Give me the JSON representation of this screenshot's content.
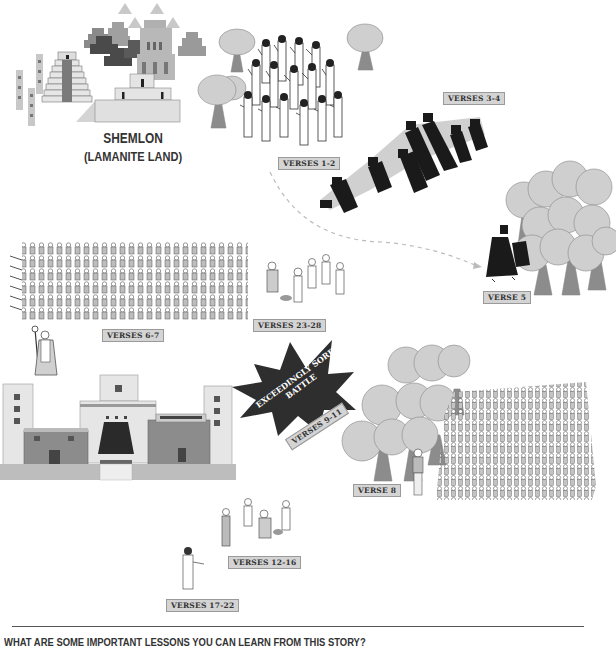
{
  "location": {
    "name": "SHEMLON",
    "subtitle": "(LAMANITE LAND)"
  },
  "labels": {
    "verses_1_2": "VERSES 1-2",
    "verses_3_4": "VERSES 3-4",
    "verse_5": "VERSE 5",
    "verses_6_7": "VERSES 6-7",
    "verses_23_28": "VERSES 23-28",
    "verse_8": "VERSE 8",
    "verses_9_11": "VERSES 9-11",
    "verses_12_16": "VERSES 12-16",
    "verses_17_22": "VERSES 17-22"
  },
  "battle": {
    "line1": "EXCEEDINGLY SORE",
    "line2": "BATTLE"
  },
  "footer": {
    "question": "WHAT ARE SOME IMPORTANT LESSONS YOU CAN LEARN FROM THIS STORY?"
  },
  "colors": {
    "dark": "#3a3a3a",
    "mid": "#8a8a8a",
    "light": "#c8c8c8",
    "tree": "#cfcfcf",
    "trunk": "#8c8c8c",
    "label_bg": "#d4d4d4"
  }
}
